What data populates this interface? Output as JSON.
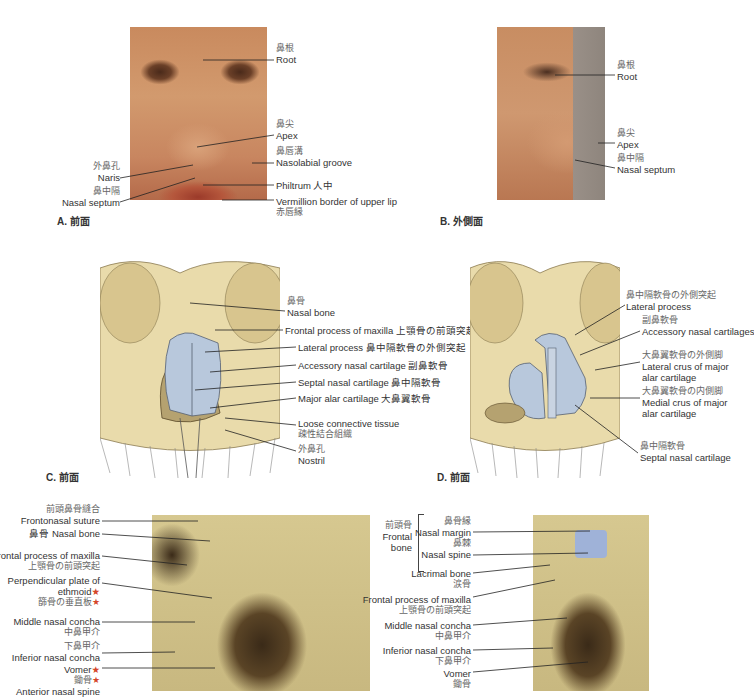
{
  "header": {
    "text": "鼻部 — 外鼻と鼻腔"
  },
  "panels": {
    "A": {
      "caption": "A. 前面",
      "labels": {
        "root_jp": "鼻根",
        "root_en": "Root",
        "apex_jp": "鼻尖",
        "apex_en": "Apex",
        "nasolabial_jp": "鼻唇溝",
        "nasolabial_en": "Nasolabial groove",
        "philtrum": "Philtrum 人中",
        "vermillion_en": "Vermillion border of upper lip",
        "vermillion_jp": "赤唇縁",
        "naris_jp": "外鼻孔",
        "naris_en": "Naris",
        "septum_jp": "鼻中隔",
        "septum_en": "Nasal septum"
      }
    },
    "B": {
      "caption": "B. 外側面",
      "labels": {
        "root_jp": "鼻根",
        "root_en": "Root",
        "apex_jp": "鼻尖",
        "apex_en": "Apex",
        "septum_jp": "鼻中隔",
        "septum_en": "Nasal septum"
      }
    },
    "C": {
      "caption": "C. 前面",
      "labels": {
        "nasal_bone_jp": "鼻骨",
        "nasal_bone_en": "Nasal bone",
        "frontal_process": "Frontal process of maxilla 上顎骨の前頭突起",
        "lateral_process": "Lateral process 鼻中隔軟骨の外側突起",
        "accessory": "Accessory nasal cartilage 副鼻軟骨",
        "septal": "Septal nasal cartilage 鼻中隔軟骨",
        "major_alar": "Major alar cartilage 大鼻翼軟骨",
        "loose_en": "Loose connective tissue",
        "loose_jp": "疎性結合組織",
        "nostril_jp": "外鼻孔",
        "nostril_en": "Nostril"
      }
    },
    "D": {
      "caption": "D. 前面",
      "labels": {
        "lateral_process_jp": "鼻中隔軟骨の外側突起",
        "lateral_process_en": "Lateral process",
        "accessory_jp": "副鼻軟骨",
        "accessory_en": "Accessory nasal cartilages",
        "lateral_crus_jp": "大鼻翼軟骨の外側脚",
        "lateral_crus_en1": "Lateral crus of major",
        "lateral_crus_en2": "alar cartilage",
        "medial_crus_jp": "大鼻翼軟骨の内側脚",
        "medial_crus_en1": "Medial crus of major",
        "medial_crus_en2": "alar cartilage",
        "septal_jp": "鼻中隔軟骨",
        "septal_en": "Septal nasal cartilage"
      }
    },
    "E": {
      "labels": {
        "frontonasal_jp": "前頭鼻骨縫合",
        "frontonasal_en": "Frontonasal suture",
        "nasal_bone": "鼻骨 Nasal bone",
        "frontal_process_en": "Frontal process of maxilla",
        "frontal_process_jp": "上顎骨の前頭突起",
        "perpendicular_en1": "Perpendicular plate of",
        "perpendicular_en2": "ethmoid",
        "perpendicular_jp": "篩骨の垂直板",
        "middle_concha_en": "Middle nasal concha",
        "middle_concha_jp": "中鼻甲介",
        "inferior_concha_jp": "下鼻甲介",
        "inferior_concha_en": "Inferior nasal concha",
        "vomer_en": "Vomer",
        "vomer_jp": "鋤骨",
        "anterior_spine_en": "Anterior nasal spine",
        "star": "★"
      }
    },
    "F": {
      "labels": {
        "frontal_bone_jp": "前頭骨",
        "frontal_bone_en1": "Frontal",
        "frontal_bone_en2": "bone",
        "nasal_margin_jp": "鼻骨縁",
        "nasal_margin_en": "Nasal margin",
        "nasal_spine_jp": "鼻棘",
        "nasal_spine_en": "Nasal spine",
        "lacrimal_en": "Lacrimal bone",
        "lacrimal_jp": "涙骨",
        "frontal_process_en": "Frontal process of maxilla",
        "frontal_process_jp": "上顎骨の前頭突起",
        "middle_concha_en": "Middle nasal concha",
        "middle_concha_jp": "中鼻甲介",
        "inferior_concha_en": "Inferior nasal concha",
        "inferior_concha_jp": "下鼻甲介",
        "vomer_en": "Vomer",
        "vomer_jp": "鋤骨"
      }
    }
  },
  "colors": {
    "cartilage": "#b8c8dc",
    "bone": "#e6d6a4",
    "star": "#d5462a",
    "highlight_blue": "#9fb2d8"
  }
}
